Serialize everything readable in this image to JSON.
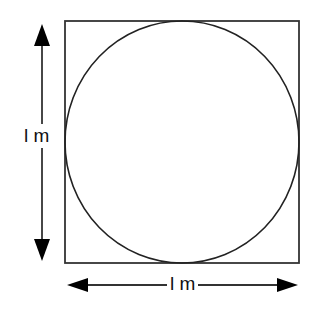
{
  "diagram": {
    "vertical_label": "l m",
    "horizontal_label": "l m",
    "colors": {
      "stroke": "#222222",
      "background": "#ffffff"
    },
    "square": {
      "x": 65,
      "y": 21,
      "size": 234
    },
    "circle": {
      "cx": 182,
      "cy": 142,
      "r": 117
    }
  }
}
